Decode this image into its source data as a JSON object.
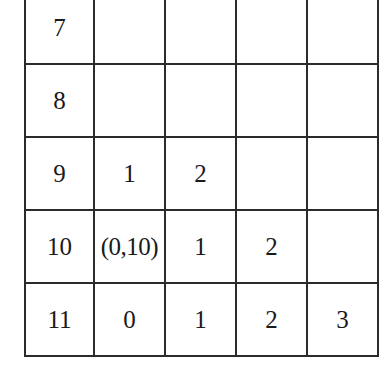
{
  "diagram": {
    "type": "grid-table",
    "colors": {
      "dark_fill": "#3b3b3b",
      "light_fill": "#9a9a9a",
      "grid_line": "#2b2b2b",
      "cell_background": "#ffffff",
      "shaded_text": "#ffffff",
      "plain_text": "#1a1a1a"
    },
    "columns": 5,
    "rows": [
      {
        "label": "7",
        "cells": [
          {
            "text": "7",
            "fill": "none",
            "kind": "row-label"
          },
          {
            "text": "",
            "fill": "none",
            "kind": "empty"
          },
          {
            "text": "",
            "fill": "none",
            "kind": "empty"
          },
          {
            "text": "",
            "fill": "none",
            "kind": "empty"
          },
          {
            "text": "",
            "fill": "none",
            "kind": "empty"
          }
        ]
      },
      {
        "label": "8",
        "cells": [
          {
            "text": "8",
            "fill": "none",
            "kind": "row-label"
          },
          {
            "text": "",
            "fill": "none",
            "kind": "empty"
          },
          {
            "text": "",
            "fill": "none",
            "kind": "empty"
          },
          {
            "text": "",
            "fill": "none",
            "kind": "empty"
          },
          {
            "text": "",
            "fill": "none",
            "kind": "empty"
          }
        ]
      },
      {
        "label": "9",
        "cells": [
          {
            "text": "9",
            "fill": "none",
            "kind": "row-label"
          },
          {
            "text": "1",
            "fill": "dark",
            "kind": "value"
          },
          {
            "text": "2",
            "fill": "dark",
            "kind": "value"
          },
          {
            "text": "",
            "fill": "none",
            "kind": "empty"
          },
          {
            "text": "",
            "fill": "none",
            "kind": "empty"
          }
        ]
      },
      {
        "label": "10",
        "cells": [
          {
            "text": "10",
            "fill": "none",
            "kind": "row-label"
          },
          {
            "text": "(0,10)",
            "fill": "light",
            "kind": "coordinate"
          },
          {
            "text": "1",
            "fill": "dark",
            "kind": "value"
          },
          {
            "text": "2",
            "fill": "dark",
            "kind": "value"
          },
          {
            "text": "",
            "fill": "none",
            "kind": "empty"
          }
        ]
      },
      {
        "label": "11",
        "cells": [
          {
            "text": "11",
            "fill": "none",
            "kind": "row-label"
          },
          {
            "text": "0",
            "fill": "none",
            "kind": "value"
          },
          {
            "text": "1",
            "fill": "none",
            "kind": "value"
          },
          {
            "text": "2",
            "fill": "none",
            "kind": "value"
          },
          {
            "text": "3",
            "fill": "none",
            "kind": "value"
          }
        ]
      }
    ]
  }
}
